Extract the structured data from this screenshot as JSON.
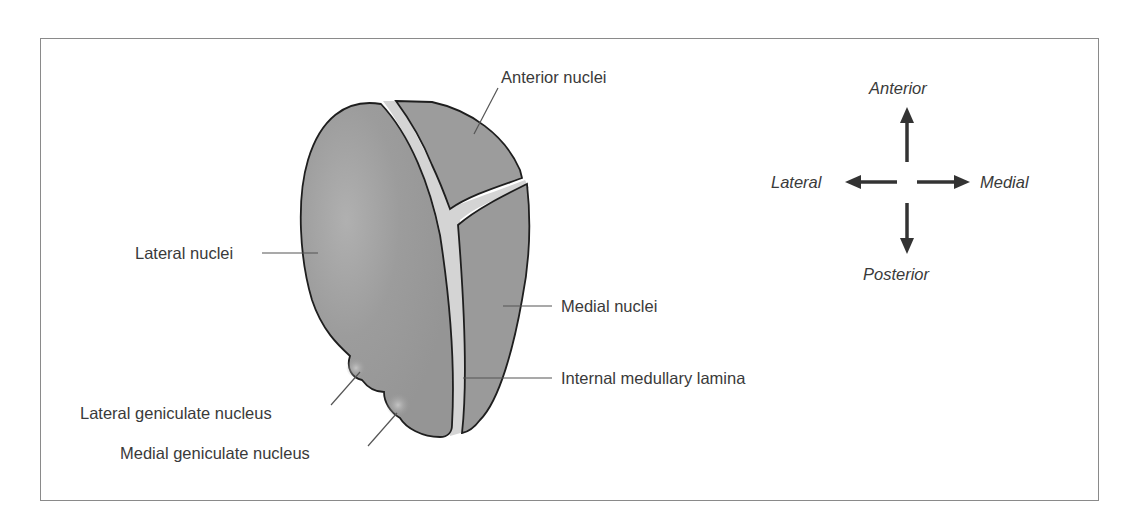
{
  "figure": {
    "labels": {
      "anterior_nuclei": "Anterior nuclei",
      "lateral_nuclei": "Lateral nuclei",
      "medial_nuclei": "Medial nuclei",
      "internal_medullary_lamina": "Internal medullary lamina",
      "lateral_geniculate_nucleus": "Lateral geniculate nucleus",
      "medial_geniculate_nucleus": "Medial geniculate nucleus"
    },
    "orientation": {
      "up": "Anterior",
      "down": "Posterior",
      "left": "Lateral",
      "right": "Medial"
    },
    "colors": {
      "nucleus_fill": "#9a9a9a",
      "nucleus_highlight": "#b4b4b4",
      "lamina_fill": "#d4d4d4",
      "outline": "#1e1e1e",
      "leader_line": "#555555",
      "arrow": "#333333",
      "frame": "#8a8a8a",
      "text": "#3a3a3a"
    }
  }
}
